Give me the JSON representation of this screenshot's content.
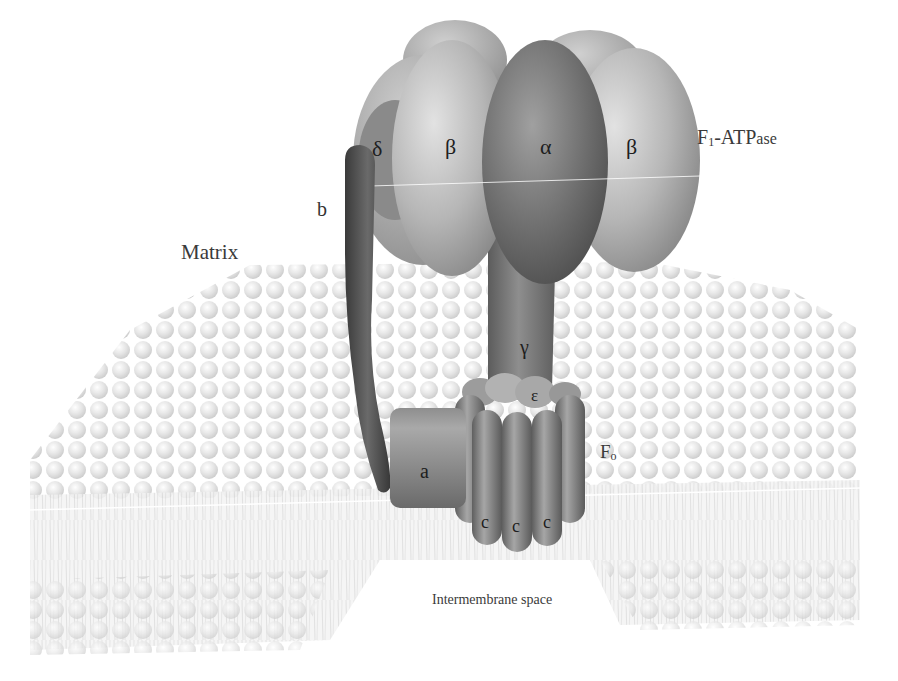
{
  "figure": {
    "colors": {
      "background": "#ffffff",
      "membrane_light": "#e6e6e6",
      "membrane_mid": "#cfcfcf",
      "beta_light": "#b9b9b9",
      "alpha_dark": "#6f6f6f",
      "stalk_b": "#4a4a4a",
      "subunit_a": "#7a7a7a",
      "c_ring": "#8a8a8a",
      "label_text": "#3a3a3a"
    }
  },
  "regions": {
    "matrix": "Matrix",
    "intermembrane": "Intermembrane space"
  },
  "complexes": {
    "f1": {
      "main": "F",
      "sub": "1",
      "suffix_big": "-ATP",
      "suffix_small": "ase"
    },
    "f0": {
      "main": "F",
      "sub": "o"
    }
  },
  "subunits": {
    "alpha": "α",
    "beta_left": "β",
    "beta_right": "β",
    "delta": "δ",
    "gamma": "γ",
    "epsilon": "ε",
    "b": "b",
    "a": "a",
    "c1": "c",
    "c2": "c",
    "c3": "c"
  }
}
